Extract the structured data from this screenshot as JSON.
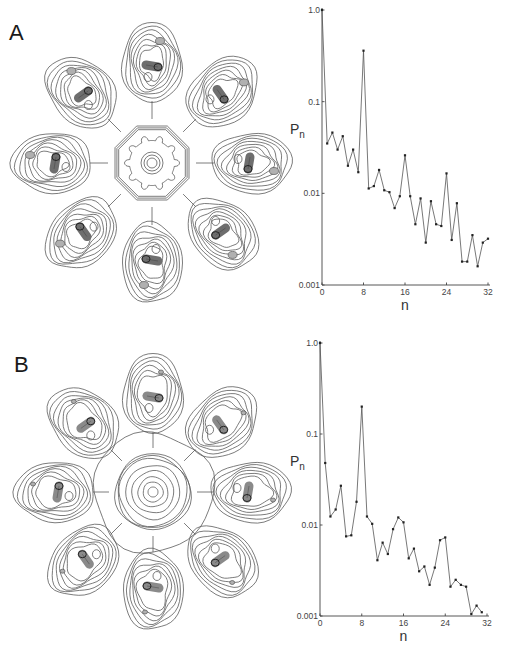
{
  "panels": [
    {
      "label": "A"
    },
    {
      "label": "B"
    }
  ],
  "chart_data": [
    {
      "panel": "A",
      "type": "line",
      "title": "",
      "xlabel": "n",
      "ylabel": "Pn",
      "ylabel_main": "P",
      "ylabel_sub": "n",
      "yscale": "log",
      "xlim": [
        0,
        32
      ],
      "ylim": [
        0.001,
        1.0
      ],
      "xticks": [
        0,
        8,
        16,
        24,
        32
      ],
      "xtick_labels": [
        "0",
        "8",
        "16",
        "24",
        "32"
      ],
      "yticks": [
        1.0,
        0.1,
        0.01,
        0.001
      ],
      "ytick_labels": [
        "1.0",
        "0.1",
        "0.01",
        "0.001"
      ],
      "grid": false,
      "legend": null,
      "x": [
        0,
        1,
        2,
        3,
        4,
        5,
        6,
        7,
        8,
        9,
        10,
        11,
        12,
        13,
        14,
        15,
        16,
        17,
        18,
        19,
        20,
        21,
        22,
        23,
        24,
        25,
        26,
        27,
        28,
        29,
        30,
        31,
        32
      ],
      "values": [
        1.0,
        0.035,
        0.046,
        0.03,
        0.042,
        0.02,
        0.03,
        0.017,
        0.36,
        0.0113,
        0.012,
        0.018,
        0.0108,
        0.0103,
        0.0069,
        0.0093,
        0.026,
        0.0093,
        0.0046,
        0.0088,
        0.0029,
        0.0082,
        0.0046,
        0.0044,
        0.0165,
        0.0031,
        0.0078,
        0.0018,
        0.0018,
        0.0035,
        0.0016,
        0.0029,
        0.0032
      ]
    },
    {
      "panel": "B",
      "type": "line",
      "title": "",
      "xlabel": "n",
      "ylabel": "Pn",
      "ylabel_main": "P",
      "ylabel_sub": "n",
      "yscale": "log",
      "xlim": [
        0,
        32
      ],
      "ylim": [
        0.001,
        1.0
      ],
      "xticks": [
        0,
        8,
        16,
        24,
        32
      ],
      "xtick_labels": [
        "0",
        "8",
        "16",
        "24",
        "32"
      ],
      "yticks": [
        1.0,
        0.1,
        0.01,
        0.001
      ],
      "ytick_labels": [
        "1.0",
        "0.1",
        "0.01",
        "0.001"
      ],
      "grid": false,
      "legend": null,
      "x": [
        0,
        1,
        2,
        3,
        4,
        5,
        6,
        7,
        8,
        9,
        10,
        11,
        12,
        13,
        14,
        15,
        16,
        17,
        18,
        19,
        20,
        21,
        22,
        23,
        24,
        25,
        26,
        27,
        28,
        29,
        30,
        31
      ],
      "values": [
        1.0,
        0.048,
        0.0124,
        0.0148,
        0.027,
        0.0075,
        0.0077,
        0.018,
        0.2,
        0.0124,
        0.0103,
        0.0041,
        0.0064,
        0.0048,
        0.009,
        0.0121,
        0.0107,
        0.0043,
        0.0055,
        0.0031,
        0.0035,
        0.0022,
        0.0034,
        0.0068,
        0.0073,
        0.0021,
        0.0025,
        0.0022,
        0.0021,
        0.00105,
        0.0013,
        0.0011
      ]
    }
  ],
  "diagrams": [
    {
      "panel": "A",
      "symmetry": 8,
      "center_style": "octagon-gear"
    },
    {
      "panel": "B",
      "symmetry": 8,
      "center_style": "concentric-rings"
    }
  ],
  "colors": {
    "contour": "#5a5a5a",
    "shade_dark": "#6e6e6e",
    "shade_light": "#b5b5b5",
    "axis": "#444444",
    "marker": "#222222"
  }
}
